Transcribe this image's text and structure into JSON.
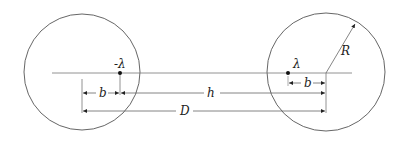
{
  "diagram": {
    "left_conductor": {
      "cx": 82,
      "cy": 72,
      "r": 58
    },
    "right_conductor": {
      "cx": 326,
      "cy": 72,
      "r": 59
    },
    "charges": [
      {
        "label": "-λ",
        "x": 120,
        "y": 73
      },
      {
        "label": "λ",
        "x": 288,
        "y": 73
      }
    ],
    "dimensions": [
      {
        "label": "b",
        "from": 82,
        "to": 120,
        "y": 93
      },
      {
        "label": "h",
        "from": 120,
        "to": 326,
        "y": 93
      },
      {
        "label": "b",
        "from": 288,
        "to": 326,
        "y": 82
      },
      {
        "label": "D",
        "from": 82,
        "to": 326,
        "y": 111
      }
    ],
    "radius_label": "R",
    "colors": {
      "stroke": "#555555",
      "text": "#222222"
    }
  },
  "labels": {
    "neg_lambda": "-λ",
    "pos_lambda": "λ",
    "b_left": "b",
    "b_right": "b",
    "h": "h",
    "D": "D",
    "R": "R"
  }
}
